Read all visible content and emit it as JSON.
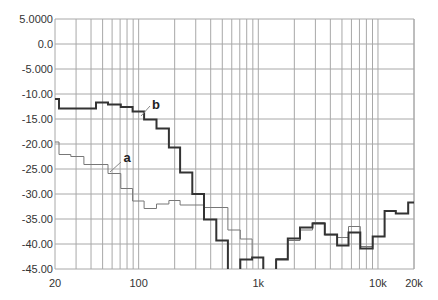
{
  "chart_data": {
    "type": "line",
    "title": "",
    "xlabel": "",
    "ylabel": "",
    "x_scale": "log",
    "xlim": [
      20,
      20000
    ],
    "ylim": [
      -45,
      5
    ],
    "grid": true,
    "legend": "inline labels",
    "y_ticks": [
      "5.0000",
      "0.0",
      "-5.000",
      "-10.00",
      "-15.00",
      "-20.00",
      "-25.00",
      "-30.00",
      "-35.00",
      "-40.00",
      "-45.00"
    ],
    "y_tick_values": [
      5,
      0,
      -5,
      -10,
      -15,
      -20,
      -25,
      -30,
      -35,
      -40,
      -45
    ],
    "x_ticks": [
      "20",
      "100",
      "1k",
      "10k",
      "20k"
    ],
    "x_tick_values": [
      20,
      100,
      1000,
      10000,
      20000
    ],
    "series": [
      {
        "name": "a",
        "color": "#777777",
        "width": 1,
        "style": "step",
        "label_pos": {
          "x": 127,
          "y": 162
        },
        "leader": [
          121,
          162,
          110,
          172
        ],
        "edges": [
          20,
          21.6,
          27.1,
          34.9,
          55.5,
          71,
          89,
          111,
          141,
          179,
          222,
          352,
          557,
          707,
          888,
          1100,
          1408,
          1764,
          2232,
          2838,
          3595,
          4552,
          5675,
          7120,
          9026,
          11349,
          14100,
          17880,
          20000
        ],
        "values": [
          -19.6,
          -22.1,
          -22.5,
          -24.1,
          -25.9,
          -28.9,
          -31.4,
          -32.9,
          -32.0,
          -31.3,
          -32.2,
          -32.7,
          -37.2,
          -39.0,
          -42.7,
          -46.0,
          -42.9,
          -39.3,
          -37.2,
          -35.7,
          -38.2,
          -38.7,
          -36.5,
          -40.5,
          -38.5,
          -33.4,
          -33.9,
          -31.7
        ]
      },
      {
        "name": "b",
        "color": "#333333",
        "width": 2,
        "style": "step",
        "label_pos": {
          "x": 156,
          "y": 109
        },
        "leader": [
          150,
          106,
          141,
          116
        ],
        "edges": [
          20,
          21.6,
          44,
          55.5,
          71,
          89,
          111,
          141,
          179,
          222,
          281,
          352,
          446,
          557,
          707,
          888,
          1100,
          1408,
          1764,
          2232,
          2838,
          3595,
          4552,
          5675,
          7120,
          9026,
          11349,
          14100,
          17880,
          20000
        ],
        "values": [
          -11.0,
          -12.9,
          -11.7,
          -12.1,
          -12.6,
          -13.5,
          -15.1,
          -16.9,
          -20.7,
          -25.7,
          -30.0,
          -35.1,
          -39.3,
          -46.0,
          -43.1,
          -42.7,
          -46.0,
          -43.1,
          -38.9,
          -36.7,
          -35.9,
          -38.1,
          -40.3,
          -37.7,
          -40.9,
          -38.5,
          -33.4,
          -33.9,
          -31.7
        ]
      }
    ]
  }
}
